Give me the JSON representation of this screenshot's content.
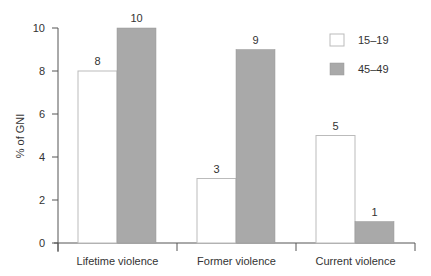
{
  "chart_data": {
    "type": "bar",
    "title": "",
    "xlabel": "",
    "ylabel": "% of GNI",
    "ylim": [
      0,
      10
    ],
    "yticks": [
      0,
      2,
      4,
      6,
      8,
      10
    ],
    "grid": false,
    "legend_position": "top-right",
    "categories": [
      "Lifetime violence",
      "Former violence",
      "Current violence"
    ],
    "series": [
      {
        "name": "15–19",
        "color": "#ffffff",
        "values": [
          8,
          3,
          5
        ]
      },
      {
        "name": "45–49",
        "color": "#a9a9a9",
        "values": [
          10,
          9,
          1
        ]
      }
    ],
    "data_labels": [
      [
        "8",
        "3",
        "5"
      ],
      [
        "10",
        "9",
        "1"
      ]
    ]
  },
  "legend": {
    "items": [
      {
        "label": "15–19",
        "color": "#ffffff"
      },
      {
        "label": "45–49",
        "color": "#a9a9a9"
      }
    ]
  },
  "axis": {
    "y_title": "% of GNI",
    "y_ticks": [
      "0",
      "2",
      "4",
      "6",
      "8",
      "10"
    ],
    "x_labels": [
      "Lifetime violence",
      "Former violence",
      "Current violence"
    ]
  }
}
